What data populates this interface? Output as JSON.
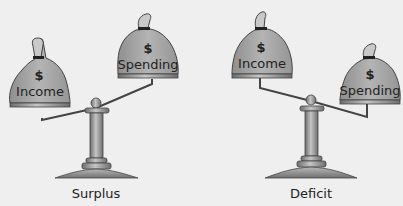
{
  "panels": [
    {
      "caption": "Surplus",
      "left_bag": {
        "symbol": "$",
        "label": "Income"
      },
      "right_bag": {
        "symbol": "$",
        "label": "Spending"
      },
      "tilt": "left-heavy"
    },
    {
      "caption": "Deficit",
      "left_bag": {
        "symbol": "$",
        "label": "Income"
      },
      "right_bag": {
        "symbol": "$",
        "label": "Spending"
      },
      "tilt": "right-heavy"
    }
  ],
  "colors": {
    "background": "#efefef",
    "bag_fill": "#a8a8a8",
    "scale_metal": "#8a8a8a",
    "outline": "#333333"
  }
}
